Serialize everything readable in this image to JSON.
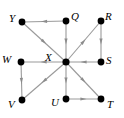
{
  "figure": {
    "type": "directed-graph-diagram",
    "width": 124,
    "height": 118,
    "background_color": "#ffffff",
    "edge_color": "#9a9a9a",
    "arrow_color": "#8c8c8c",
    "node_color": "#000000",
    "label_color": "#000000"
  },
  "nodes": [
    {
      "id": "Y",
      "label": "Y",
      "x": 22,
      "y": 22,
      "label_x": 9,
      "label_y": 13
    },
    {
      "id": "Q",
      "label": "Q",
      "x": 66,
      "y": 21,
      "label_x": 71,
      "label_y": 11
    },
    {
      "id": "R",
      "label": "R",
      "x": 101,
      "y": 21,
      "label_x": 105,
      "label_y": 11
    },
    {
      "id": "W",
      "label": "W",
      "x": 21,
      "y": 62,
      "label_x": 2,
      "label_y": 54
    },
    {
      "id": "X",
      "label": "X",
      "x": 66,
      "y": 62,
      "label_x": 45,
      "label_y": 52
    },
    {
      "id": "S",
      "label": "S",
      "x": 101,
      "y": 62,
      "label_x": 106,
      "label_y": 55
    },
    {
      "id": "V",
      "label": "V",
      "x": 22,
      "y": 100,
      "label_x": 8,
      "label_y": 99
    },
    {
      "id": "U",
      "label": "U",
      "x": 66,
      "y": 99,
      "label_x": 51,
      "label_y": 97
    },
    {
      "id": "T",
      "label": "T",
      "x": 101,
      "y": 99,
      "label_x": 107,
      "label_y": 99
    }
  ],
  "edges": [
    {
      "id": "q-y",
      "from": "Q",
      "to": "Y",
      "direction": "left",
      "x1": 66,
      "y1": 21,
      "x2": 22,
      "y2": 22
    },
    {
      "id": "q-x",
      "from": "Q",
      "to": "X",
      "direction": "down",
      "x1": 66,
      "y1": 21,
      "x2": 66,
      "y2": 62
    },
    {
      "id": "y-x",
      "from": "Y",
      "to": "X",
      "direction": "down-right",
      "x1": 22,
      "y1": 22,
      "x2": 66,
      "y2": 62
    },
    {
      "id": "x-r",
      "from": "X",
      "to": "R",
      "direction": "up-right",
      "x1": 66,
      "y1": 62,
      "x2": 101,
      "y2": 21
    },
    {
      "id": "r-s",
      "from": "R",
      "to": "S",
      "direction": "down",
      "x1": 101,
      "y1": 21,
      "x2": 101,
      "y2": 62
    },
    {
      "id": "s-x",
      "from": "S",
      "to": "X",
      "direction": "left",
      "x1": 101,
      "y1": 62,
      "x2": 66,
      "y2": 62
    },
    {
      "id": "x-w",
      "from": "X",
      "to": "W",
      "direction": "left",
      "x1": 66,
      "y1": 62,
      "x2": 21,
      "y2": 62
    },
    {
      "id": "w-v",
      "from": "W",
      "to": "V",
      "direction": "down",
      "x1": 21,
      "y1": 62,
      "x2": 22,
      "y2": 100
    },
    {
      "id": "x-v",
      "from": "X",
      "to": "V",
      "direction": "down-left",
      "x1": 66,
      "y1": 62,
      "x2": 22,
      "y2": 100
    },
    {
      "id": "x-u",
      "from": "X",
      "to": "U",
      "direction": "down",
      "x1": 66,
      "y1": 62,
      "x2": 66,
      "y2": 99
    },
    {
      "id": "x-t",
      "from": "X",
      "to": "T",
      "direction": "down-right",
      "x1": 66,
      "y1": 62,
      "x2": 101,
      "y2": 99
    },
    {
      "id": "u-t",
      "from": "U",
      "to": "T",
      "direction": "right",
      "x1": 66,
      "y1": 99,
      "x2": 101,
      "y2": 99
    }
  ]
}
